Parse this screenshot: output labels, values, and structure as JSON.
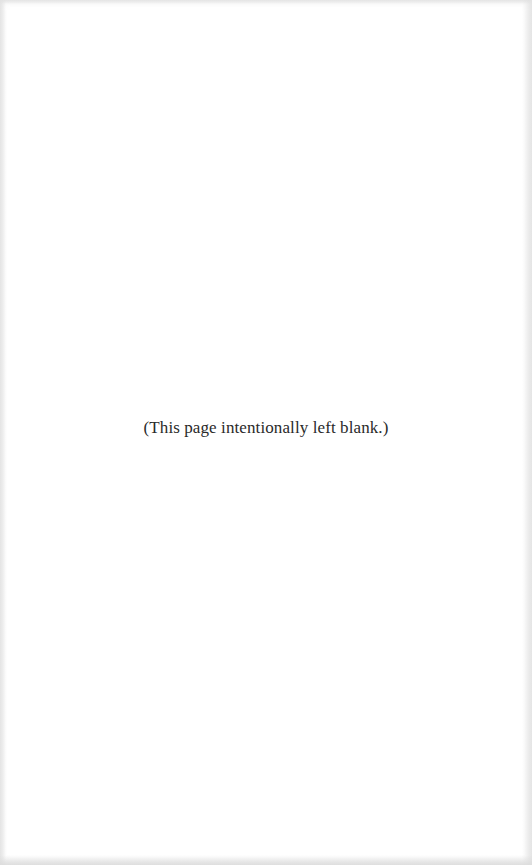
{
  "page": {
    "notice": "(This page intentionally left blank.)",
    "background_color": "#ffffff",
    "text_color": "#2a2a2a"
  }
}
